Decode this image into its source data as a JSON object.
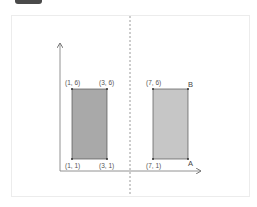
{
  "badge": {
    "color": "#4a4a4a"
  },
  "diagram": {
    "frame_border_color": "#ececec",
    "axis_color": "#777777",
    "mirror_line_color": "#999999",
    "shapes": [
      {
        "name": "original-rectangle",
        "fill": "#a9a9a9",
        "stroke": "#555555",
        "vertices": [
          {
            "label": "(1, 6)",
            "x": 1,
            "y": 6
          },
          {
            "label": "(3, 6)",
            "x": 3,
            "y": 6
          },
          {
            "label": "(3, 1)",
            "x": 3,
            "y": 1
          },
          {
            "label": "(1, 1)",
            "x": 1,
            "y": 1
          }
        ]
      },
      {
        "name": "image-rectangle",
        "fill": "#c6c6c6",
        "stroke": "#555555",
        "vertices": [
          {
            "label": "(7, 6)",
            "x": 7,
            "y": 6
          },
          {
            "label": "B",
            "x": 9,
            "y": 6
          },
          {
            "label": "A",
            "x": 9,
            "y": 1
          },
          {
            "label": "(7, 1)",
            "x": 7,
            "y": 1
          }
        ]
      }
    ],
    "labels": {
      "tl_left": "(1, 6)",
      "tr_left": "(3, 6)",
      "bl_left": "(1, 1)",
      "br_left": "(3, 1)",
      "tl_right": "(7, 6)",
      "tr_right": "B",
      "bl_right": "(7, 1)",
      "br_right": "A"
    }
  }
}
